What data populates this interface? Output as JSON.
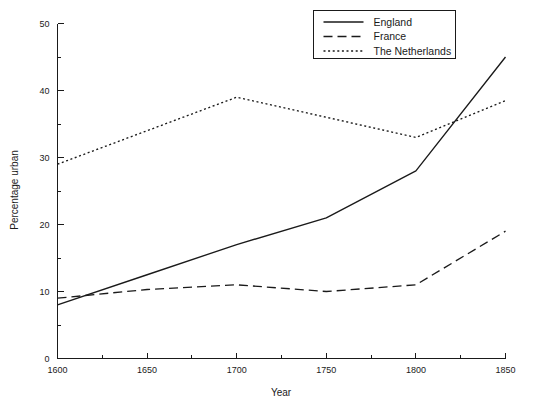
{
  "chart_data": {
    "type": "line",
    "title": "",
    "xlabel": "Year",
    "ylabel": "Percentage urban",
    "xlim": [
      1600,
      1850
    ],
    "ylim": [
      0,
      50
    ],
    "grid": false,
    "legend_position": "top-right",
    "x": [
      1600,
      1650,
      1700,
      1750,
      1800,
      1850
    ],
    "xticks": [
      "1600",
      "1650",
      "1700",
      "1750",
      "1800",
      "1850"
    ],
    "xtick_values": [
      1600,
      1650,
      1700,
      1750,
      1800,
      1850
    ],
    "xminor_values": [
      1625,
      1675,
      1725,
      1775,
      1825
    ],
    "yticks": [
      "0",
      "10",
      "20",
      "30",
      "40",
      "50"
    ],
    "ytick_values": [
      0,
      10,
      20,
      30,
      40,
      50
    ],
    "yminor_values": [
      5,
      15,
      25,
      35,
      45
    ],
    "series": [
      {
        "name": "England",
        "style": "solid",
        "color": "#1a1a1a",
        "values": [
          8,
          12.5,
          17,
          21,
          28,
          45
        ]
      },
      {
        "name": "France",
        "style": "dashed",
        "color": "#1a1a1a",
        "values": [
          9,
          10.3,
          11,
          10,
          11,
          19
        ]
      },
      {
        "name": "The Netherlands",
        "style": "dotted",
        "color": "#1a1a1a",
        "values": [
          29,
          34,
          39,
          36,
          33,
          38.5
        ]
      }
    ]
  },
  "legend": {
    "items": [
      {
        "label": "England"
      },
      {
        "label": "France"
      },
      {
        "label": "The Netherlands"
      }
    ]
  },
  "axes": {
    "x_title": "Year",
    "y_title": "Percentage urban"
  }
}
